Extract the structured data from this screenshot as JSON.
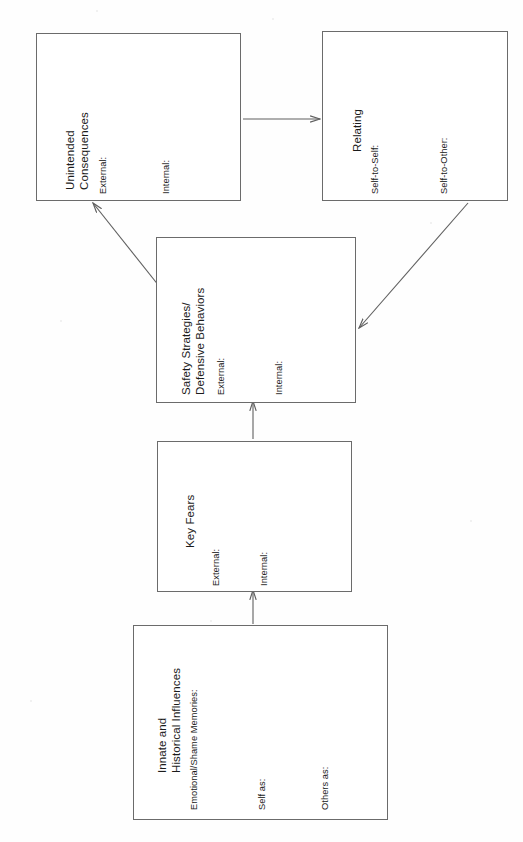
{
  "diagram": {
    "type": "flowchart",
    "orientation": "rotated-90-ccw",
    "nodes": [
      {
        "id": "unintended-consequences",
        "title": "Unintended\nConsequences",
        "title_line1": "Unintended",
        "title_line2": "Consequences",
        "fields": [
          "External:",
          "Internal:"
        ]
      },
      {
        "id": "relating",
        "title": "Relating",
        "title_line1": "Relating",
        "title_line2": "",
        "fields": [
          "Self-to-Self:",
          "Self-to-Other:"
        ]
      },
      {
        "id": "safety-strategies",
        "title": "Safety Strategies/\nDefensive Behaviors",
        "title_line1": "Safety Strategies/",
        "title_line2": "Defensive Behaviors",
        "fields": [
          "External:",
          "Internal:"
        ]
      },
      {
        "id": "key-fears",
        "title": "Key Fears",
        "title_line1": "Key Fears",
        "title_line2": "",
        "fields": [
          "External:",
          "Internal:"
        ]
      },
      {
        "id": "innate-historical-influences",
        "title": "Innate and\nHistorical Influences",
        "title_line1": "Innate and",
        "title_line2": "Historical Influences",
        "fields": [
          "Emotional/Shame Memories:",
          "Self as:",
          "Others as:"
        ]
      }
    ],
    "edges": [
      {
        "id": "edge-unintended-to-relating",
        "from": "unintended-consequences",
        "to": "relating"
      },
      {
        "id": "edge-relating-to-safety",
        "from": "relating",
        "to": "safety-strategies"
      },
      {
        "id": "edge-safety-to-unintended",
        "from": "safety-strategies",
        "to": "unintended-consequences"
      },
      {
        "id": "edge-keyfears-to-safety",
        "from": "key-fears",
        "to": "safety-strategies"
      },
      {
        "id": "edge-innate-to-keyfears",
        "from": "innate-historical-influences",
        "to": "key-fears"
      }
    ],
    "colors": {
      "box_border": "#6b6b6b",
      "line": "#5f5f5f",
      "text": "#1b1b1b",
      "background": "#fefefe"
    }
  }
}
